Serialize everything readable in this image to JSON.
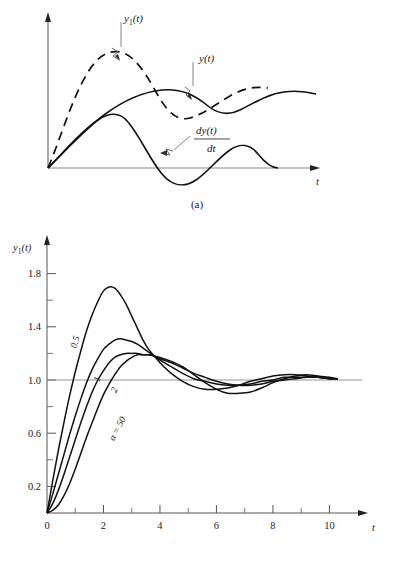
{
  "figure_a": {
    "caption": "(a)",
    "y_axis_label": "",
    "x_axis_label": "t",
    "annotations": [
      {
        "id": "y1",
        "text_main": "y",
        "text_sub": "1",
        "text_tail": "(t)"
      },
      {
        "id": "y",
        "text_main": "y(t)"
      },
      {
        "id": "dydt",
        "numerator": "dy(t)",
        "denominator": "dt"
      }
    ],
    "curves": [
      {
        "name": "y1(t)",
        "style": "dashed"
      },
      {
        "name": "y(t)",
        "style": "solid"
      },
      {
        "name": "dy(t)/dt",
        "style": "solid"
      }
    ]
  },
  "figure_b": {
    "caption": "(b)"
  },
  "chart_data": {
    "type": "line",
    "title": "",
    "xlabel": "t",
    "ylabel": "y_1(t)",
    "ylabel_main": "y",
    "ylabel_sub": "1",
    "ylabel_tail": "(t)",
    "xlim": [
      0,
      10.8
    ],
    "ylim": [
      0,
      2.0
    ],
    "xticks": [
      0,
      2,
      4,
      6,
      8,
      10
    ],
    "xtick_labels": [
      "0",
      "2",
      "4",
      "6",
      "8",
      "10"
    ],
    "xminor": [
      1,
      3,
      5,
      7,
      9
    ],
    "yticks": [
      0.2,
      0.6,
      1.0,
      1.4,
      1.8
    ],
    "ytick_labels": [
      "0.2",
      "0.6",
      "1.0",
      "1.4",
      "1.8"
    ],
    "yminor": [
      0.4,
      0.8,
      1.2,
      1.6
    ],
    "grid": false,
    "reference_line": 1.0,
    "legend_position": "inline-curve-labels",
    "series": [
      {
        "name": "0.5",
        "label": "0.5",
        "alpha": 0.5,
        "points": [
          [
            0.0,
            0.0
          ],
          [
            0.2,
            0.24
          ],
          [
            0.4,
            0.47
          ],
          [
            0.6,
            0.68
          ],
          [
            0.8,
            0.88
          ],
          [
            1.0,
            1.06
          ],
          [
            1.2,
            1.22
          ],
          [
            1.4,
            1.37
          ],
          [
            1.6,
            1.49
          ],
          [
            1.8,
            1.59
          ],
          [
            2.0,
            1.67
          ],
          [
            2.2,
            1.7
          ],
          [
            2.4,
            1.69
          ],
          [
            2.6,
            1.64
          ],
          [
            2.8,
            1.57
          ],
          [
            3.0,
            1.48
          ],
          [
            3.2,
            1.39
          ],
          [
            3.4,
            1.3
          ],
          [
            3.6,
            1.23
          ],
          [
            3.8,
            1.18
          ],
          [
            4.0,
            1.13
          ],
          [
            4.4,
            1.05
          ],
          [
            4.8,
            0.99
          ],
          [
            5.2,
            0.95
          ],
          [
            5.6,
            0.93
          ],
          [
            6.0,
            0.93
          ],
          [
            6.4,
            0.94
          ],
          [
            6.8,
            0.96
          ],
          [
            7.2,
            0.99
          ],
          [
            7.6,
            1.01
          ],
          [
            8.0,
            1.03
          ],
          [
            8.4,
            1.04
          ],
          [
            8.8,
            1.04
          ],
          [
            9.2,
            1.03
          ],
          [
            9.6,
            1.02
          ],
          [
            10.0,
            1.01
          ],
          [
            10.3,
            1.01
          ]
        ]
      },
      {
        "name": "1",
        "label": "1",
        "alpha": 1,
        "points": [
          [
            0.0,
            0.0
          ],
          [
            0.2,
            0.14
          ],
          [
            0.4,
            0.29
          ],
          [
            0.6,
            0.44
          ],
          [
            0.8,
            0.59
          ],
          [
            1.0,
            0.73
          ],
          [
            1.2,
            0.86
          ],
          [
            1.4,
            0.98
          ],
          [
            1.6,
            1.08
          ],
          [
            1.8,
            1.16
          ],
          [
            2.0,
            1.23
          ],
          [
            2.2,
            1.27
          ],
          [
            2.4,
            1.3
          ],
          [
            2.6,
            1.31
          ],
          [
            2.8,
            1.3
          ],
          [
            3.0,
            1.29
          ],
          [
            3.2,
            1.27
          ],
          [
            3.4,
            1.24
          ],
          [
            3.6,
            1.21
          ],
          [
            3.8,
            1.18
          ],
          [
            4.0,
            1.15
          ],
          [
            4.4,
            1.1
          ],
          [
            4.8,
            1.05
          ],
          [
            5.2,
            1.01
          ],
          [
            5.6,
            0.99
          ],
          [
            6.0,
            0.97
          ],
          [
            6.4,
            0.96
          ],
          [
            6.8,
            0.96
          ],
          [
            7.2,
            0.97
          ],
          [
            7.6,
            0.99
          ],
          [
            8.0,
            1.0
          ],
          [
            8.4,
            1.02
          ],
          [
            8.8,
            1.02
          ],
          [
            9.2,
            1.02
          ],
          [
            9.6,
            1.02
          ],
          [
            10.0,
            1.01
          ],
          [
            10.3,
            1.01
          ]
        ]
      },
      {
        "name": "2",
        "label": "2",
        "alpha": 2,
        "points": [
          [
            0.0,
            0.0
          ],
          [
            0.2,
            0.07
          ],
          [
            0.4,
            0.17
          ],
          [
            0.6,
            0.29
          ],
          [
            0.8,
            0.42
          ],
          [
            1.0,
            0.55
          ],
          [
            1.2,
            0.68
          ],
          [
            1.4,
            0.8
          ],
          [
            1.6,
            0.91
          ],
          [
            1.8,
            1.0
          ],
          [
            2.0,
            1.07
          ],
          [
            2.2,
            1.13
          ],
          [
            2.4,
            1.17
          ],
          [
            2.6,
            1.19
          ],
          [
            2.8,
            1.2
          ],
          [
            3.0,
            1.2
          ],
          [
            3.2,
            1.2
          ],
          [
            3.4,
            1.19
          ],
          [
            3.6,
            1.19
          ],
          [
            3.8,
            1.18
          ],
          [
            4.0,
            1.16
          ],
          [
            4.4,
            1.13
          ],
          [
            4.8,
            1.09
          ],
          [
            5.2,
            1.05
          ],
          [
            5.6,
            1.02
          ],
          [
            6.0,
            0.99
          ],
          [
            6.4,
            0.97
          ],
          [
            6.8,
            0.96
          ],
          [
            7.2,
            0.96
          ],
          [
            7.6,
            0.97
          ],
          [
            8.0,
            0.99
          ],
          [
            8.4,
            1.0
          ],
          [
            8.8,
            1.01
          ],
          [
            9.2,
            1.02
          ],
          [
            9.6,
            1.02
          ],
          [
            10.0,
            1.01
          ],
          [
            10.3,
            1.01
          ]
        ]
      },
      {
        "name": "a=50",
        "label": "α = 50",
        "alpha": 50,
        "points": [
          [
            0.0,
            0.0
          ],
          [
            0.2,
            0.02
          ],
          [
            0.4,
            0.06
          ],
          [
            0.6,
            0.13
          ],
          [
            0.8,
            0.22
          ],
          [
            1.0,
            0.33
          ],
          [
            1.2,
            0.45
          ],
          [
            1.4,
            0.57
          ],
          [
            1.6,
            0.68
          ],
          [
            1.8,
            0.79
          ],
          [
            2.0,
            0.89
          ],
          [
            2.2,
            0.97
          ],
          [
            2.4,
            1.04
          ],
          [
            2.6,
            1.1
          ],
          [
            2.8,
            1.14
          ],
          [
            3.0,
            1.17
          ],
          [
            3.2,
            1.19
          ],
          [
            3.4,
            1.19
          ],
          [
            3.6,
            1.19
          ],
          [
            3.8,
            1.18
          ],
          [
            4.0,
            1.17
          ],
          [
            4.4,
            1.14
          ],
          [
            4.8,
            1.1
          ],
          [
            5.2,
            1.04
          ],
          [
            5.6,
            0.98
          ],
          [
            6.0,
            0.93
          ],
          [
            6.4,
            0.9
          ],
          [
            6.8,
            0.9
          ],
          [
            7.2,
            0.91
          ],
          [
            7.6,
            0.94
          ],
          [
            8.0,
            0.98
          ],
          [
            8.4,
            1.01
          ],
          [
            8.8,
            1.03
          ],
          [
            9.2,
            1.04
          ],
          [
            9.6,
            1.03
          ],
          [
            10.0,
            1.02
          ],
          [
            10.3,
            1.01
          ]
        ]
      }
    ]
  }
}
